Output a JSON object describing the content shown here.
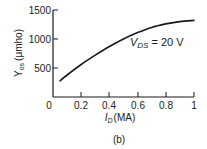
{
  "chart_data": {
    "type": "line",
    "title": "",
    "caption": "(b)",
    "xlabel": "I_D (MA)",
    "xlabel_main": "I",
    "xlabel_sub": "D",
    "xlabel_unit": "(MA)",
    "ylabel": "Y_os (µmho)",
    "ylabel_main": "Y",
    "ylabel_sub": "os",
    "ylabel_unit": "(µmho)",
    "xlim": [
      0,
      1
    ],
    "ylim": [
      0,
      1500
    ],
    "x_ticks": [
      "0",
      "0.2",
      "0.4",
      "0.6",
      "0.8",
      "1"
    ],
    "y_ticks": [
      "500",
      "1000",
      "1500"
    ],
    "grid": false,
    "annotation": {
      "main": "V",
      "sub": "DS",
      "rest": " = 20 V"
    },
    "series": [
      {
        "name": "V_DS = 20 V",
        "x": [
          0.05,
          0.1,
          0.2,
          0.3,
          0.4,
          0.5,
          0.6,
          0.7,
          0.8,
          0.9,
          1.0
        ],
        "values": [
          280,
          380,
          560,
          720,
          870,
          1000,
          1110,
          1200,
          1260,
          1300,
          1320
        ]
      }
    ]
  }
}
